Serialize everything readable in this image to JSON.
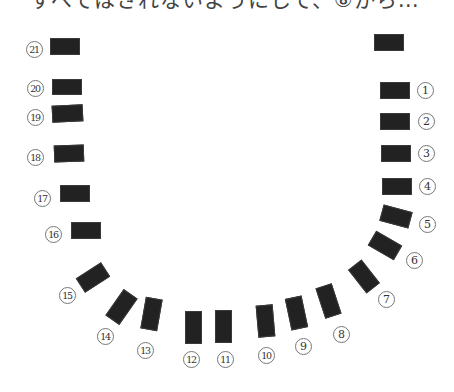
{
  "header": {
    "text": "すべてはされないようにして、⑧から…"
  },
  "diagram": {
    "type": "u-shaped-seating-layout",
    "block_color": "#222222",
    "label_style": "circled-number",
    "unlabeled_block": {
      "cx": 389,
      "cy": 42,
      "w": 30,
      "h": 17,
      "rot": 0
    },
    "seats": [
      {
        "num": "1",
        "glyph": "1",
        "cx": 395,
        "cy": 90,
        "w": 30,
        "h": 17,
        "rot": 0,
        "lx": 425,
        "ly": 90
      },
      {
        "num": "2",
        "glyph": "2",
        "cx": 395,
        "cy": 121,
        "w": 30,
        "h": 17,
        "rot": 0,
        "lx": 426,
        "ly": 121
      },
      {
        "num": "3",
        "glyph": "3",
        "cx": 396,
        "cy": 153,
        "w": 30,
        "h": 17,
        "rot": 0,
        "lx": 426,
        "ly": 153
      },
      {
        "num": "4",
        "glyph": "4",
        "cx": 397,
        "cy": 186,
        "w": 30,
        "h": 17,
        "rot": 0,
        "lx": 427,
        "ly": 186
      },
      {
        "num": "5",
        "glyph": "5",
        "cx": 396,
        "cy": 216,
        "w": 30,
        "h": 17,
        "rot": 15,
        "lx": 427,
        "ly": 224
      },
      {
        "num": "6",
        "glyph": "6",
        "cx": 385,
        "cy": 245,
        "w": 30,
        "h": 17,
        "rot": 30,
        "lx": 414,
        "ly": 260
      },
      {
        "num": "7",
        "glyph": "7",
        "cx": 364,
        "cy": 276,
        "w": 30,
        "h": 17,
        "rot": 52,
        "lx": 386,
        "ly": 299
      },
      {
        "num": "8",
        "glyph": "8",
        "cx": 328,
        "cy": 301,
        "w": 17,
        "h": 32,
        "rot": -18,
        "lx": 341,
        "ly": 334
      },
      {
        "num": "9",
        "glyph": "9",
        "cx": 296,
        "cy": 313,
        "w": 17,
        "h": 32,
        "rot": -12,
        "lx": 303,
        "ly": 346
      },
      {
        "num": "10",
        "glyph": "10",
        "cx": 265,
        "cy": 321,
        "w": 17,
        "h": 32,
        "rot": -5,
        "lx": 266,
        "ly": 355
      },
      {
        "num": "11",
        "glyph": "11",
        "cx": 223,
        "cy": 326,
        "w": 17,
        "h": 33,
        "rot": 0,
        "lx": 225,
        "ly": 359
      },
      {
        "num": "12",
        "glyph": "12",
        "cx": 193,
        "cy": 327,
        "w": 17,
        "h": 33,
        "rot": 0,
        "lx": 191,
        "ly": 359
      },
      {
        "num": "13",
        "glyph": "13",
        "cx": 151,
        "cy": 314,
        "w": 17,
        "h": 32,
        "rot": 10,
        "lx": 145,
        "ly": 350
      },
      {
        "num": "14",
        "glyph": "14",
        "cx": 121,
        "cy": 307,
        "w": 17,
        "h": 32,
        "rot": 35,
        "lx": 105,
        "ly": 336
      },
      {
        "num": "15",
        "glyph": "15",
        "cx": 93,
        "cy": 277,
        "w": 30,
        "h": 17,
        "rot": -33,
        "lx": 67,
        "ly": 295
      },
      {
        "num": "16",
        "glyph": "16",
        "cx": 86,
        "cy": 230,
        "w": 30,
        "h": 17,
        "rot": 0,
        "lx": 53,
        "ly": 234
      },
      {
        "num": "17",
        "glyph": "17",
        "cx": 75,
        "cy": 193,
        "w": 30,
        "h": 17,
        "rot": 0,
        "lx": 42,
        "ly": 198
      },
      {
        "num": "18",
        "glyph": "18",
        "cx": 69,
        "cy": 153,
        "w": 30,
        "h": 17,
        "rot": -2,
        "lx": 35,
        "ly": 157
      },
      {
        "num": "19",
        "glyph": "19",
        "cx": 67,
        "cy": 113,
        "w": 31,
        "h": 17,
        "rot": -3,
        "lx": 35,
        "ly": 117
      },
      {
        "num": "20",
        "glyph": "20",
        "cx": 67,
        "cy": 87,
        "w": 30,
        "h": 16,
        "rot": 0,
        "lx": 35,
        "ly": 88
      },
      {
        "num": "21",
        "glyph": "21",
        "cx": 65,
        "cy": 46,
        "w": 30,
        "h": 17,
        "rot": 0,
        "lx": 34,
        "ly": 49
      }
    ]
  }
}
